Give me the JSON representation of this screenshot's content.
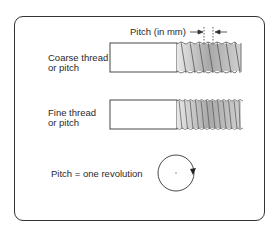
{
  "diagram": {
    "pitch_label": "Pitch (in mm)",
    "coarse": {
      "line1": "Coarse thread",
      "line2": "or pitch",
      "thread_count": 7
    },
    "fine": {
      "line1": "Fine thread",
      "line2": "or pitch",
      "thread_count": 12
    },
    "revolution_label": "Pitch  =  one revolution",
    "colors": {
      "line": "#333333",
      "thread_fill": "#b5b5b5",
      "thread_light": "#e6e6e6"
    }
  }
}
